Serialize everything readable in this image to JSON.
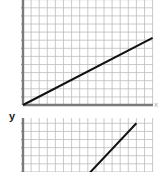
{
  "chart_data": [
    {
      "type": "line",
      "title": "",
      "xlabel": "x",
      "ylabel": "",
      "grid": true,
      "xlim": [
        0,
        16
      ],
      "ylim": [
        0,
        13
      ],
      "series": [
        {
          "name": "line",
          "x": [
            0,
            16
          ],
          "y": [
            0,
            8.3
          ]
        }
      ]
    },
    {
      "type": "line",
      "title": "",
      "xlabel": "",
      "ylabel": "y",
      "grid": true,
      "xlim": [
        0,
        16
      ],
      "ylim": [
        0,
        7
      ],
      "series": [
        {
          "name": "line",
          "x": [
            7.4,
            14
          ],
          "y": [
            0,
            7
          ]
        }
      ]
    }
  ],
  "labels": {
    "top_x": "x",
    "bottom_y": "y"
  },
  "colors": {
    "grid": "#bdbdbd",
    "axis": "#7a7a7a",
    "line": "#111111"
  }
}
